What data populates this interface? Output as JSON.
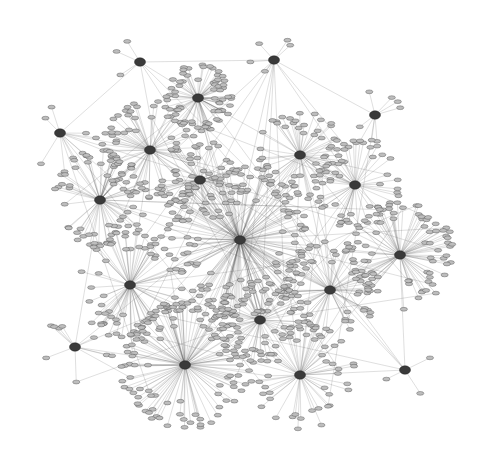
{
  "diagram": {
    "type": "network-graph",
    "layout": "force-directed radial clusters",
    "background": "#ffffff",
    "colors": {
      "edge": "#555555",
      "leaf_node": "#bdbdbd",
      "hub_node": "#3a3a3a"
    },
    "hubs": [
      {
        "id": "h1",
        "x": 198,
        "y": 98,
        "n": 70,
        "r": 34
      },
      {
        "id": "h2",
        "x": 140,
        "y": 62,
        "n": 3,
        "r": 28
      },
      {
        "id": "h3",
        "x": 274,
        "y": 60,
        "n": 5,
        "r": 24
      },
      {
        "id": "h4",
        "x": 375,
        "y": 115,
        "n": 7,
        "r": 28
      },
      {
        "id": "h5",
        "x": 60,
        "y": 133,
        "n": 8,
        "r": 40
      },
      {
        "id": "h6",
        "x": 100,
        "y": 200,
        "n": 60,
        "r": 50
      },
      {
        "id": "h7",
        "x": 355,
        "y": 185,
        "n": 45,
        "r": 45
      },
      {
        "id": "h8",
        "x": 400,
        "y": 255,
        "n": 80,
        "r": 55
      },
      {
        "id": "h9",
        "x": 75,
        "y": 347,
        "n": 9,
        "r": 40
      },
      {
        "id": "h10",
        "x": 185,
        "y": 365,
        "n": 110,
        "r": 65
      },
      {
        "id": "h11",
        "x": 300,
        "y": 375,
        "n": 50,
        "r": 55
      },
      {
        "id": "h12",
        "x": 405,
        "y": 370,
        "n": 3,
        "r": 30
      },
      {
        "id": "h13",
        "x": 130,
        "y": 285,
        "n": 70,
        "r": 55
      },
      {
        "id": "h14",
        "x": 300,
        "y": 155,
        "n": 50,
        "r": 45
      },
      {
        "id": "h15",
        "x": 240,
        "y": 240,
        "n": 160,
        "r": 80
      },
      {
        "id": "h16",
        "x": 150,
        "y": 150,
        "n": 60,
        "r": 50
      },
      {
        "id": "h17",
        "x": 330,
        "y": 290,
        "n": 60,
        "r": 50
      },
      {
        "id": "h18",
        "x": 260,
        "y": 320,
        "n": 50,
        "r": 45
      },
      {
        "id": "h19",
        "x": 200,
        "y": 180,
        "n": 50,
        "r": 45
      }
    ],
    "node_labels": "illegible at screenshot resolution"
  }
}
